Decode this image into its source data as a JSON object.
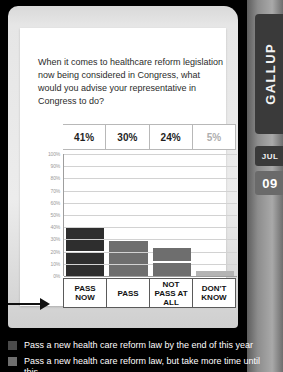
{
  "rail": {
    "tabs": [
      {
        "name": "gallup",
        "label": "GALLUP"
      },
      {
        "name": "jul",
        "label": "JUL"
      },
      {
        "name": "day",
        "label": "09"
      }
    ]
  },
  "card": {
    "slider": {
      "name": "scrollbar-slider",
      "position_pct": 24
    },
    "question": "When it comes to healthcare reform legislation now being considered in Congress, what would you advise your representative in Congress to do?"
  },
  "chart_data": {
    "type": "bar",
    "title": "When it comes to healthcare reform legislation now being considered in Congress, what would you advise your representative in Congress to do?",
    "xlabel": "",
    "ylabel": "",
    "ylim": [
      0,
      100
    ],
    "grid": true,
    "legend_position": "below",
    "categories": [
      "PASS NOW",
      "PASS",
      "NOT PASS AT ALL",
      "DON'T KNOW"
    ],
    "values": [
      41,
      30,
      24,
      5
    ],
    "value_labels": [
      "41%",
      "30%",
      "24%",
      "5%"
    ],
    "ticks": [
      "100%",
      "90%",
      "80%",
      "70%",
      "60%",
      "50%",
      "40%",
      "30%",
      "20%",
      "10%",
      "0%"
    ],
    "tick_values": [
      100,
      90,
      80,
      70,
      60,
      50,
      40,
      30,
      20,
      10,
      0
    ],
    "bar_colors": [
      "#2e2e2e",
      "#6e6e6e",
      "#6e6e6e",
      "#b4b4b4"
    ]
  },
  "legend": {
    "items": [
      {
        "swatch": "#4a4a4a",
        "text": "Pass a new health care reform law by the end of this year"
      },
      {
        "swatch": "#6e6e6e",
        "text": "Pass a new health care reform law, but take more time until this"
      }
    ]
  },
  "colors": {
    "background": "#000000",
    "card": "#e6e6e6",
    "sheet": "#ffffff",
    "rail": "#8d8d8d",
    "tab": "#3a3a3a",
    "accent_dark": "#2e2e2e",
    "accent_mid": "#6e6e6e",
    "accent_light": "#b4b4b4"
  }
}
